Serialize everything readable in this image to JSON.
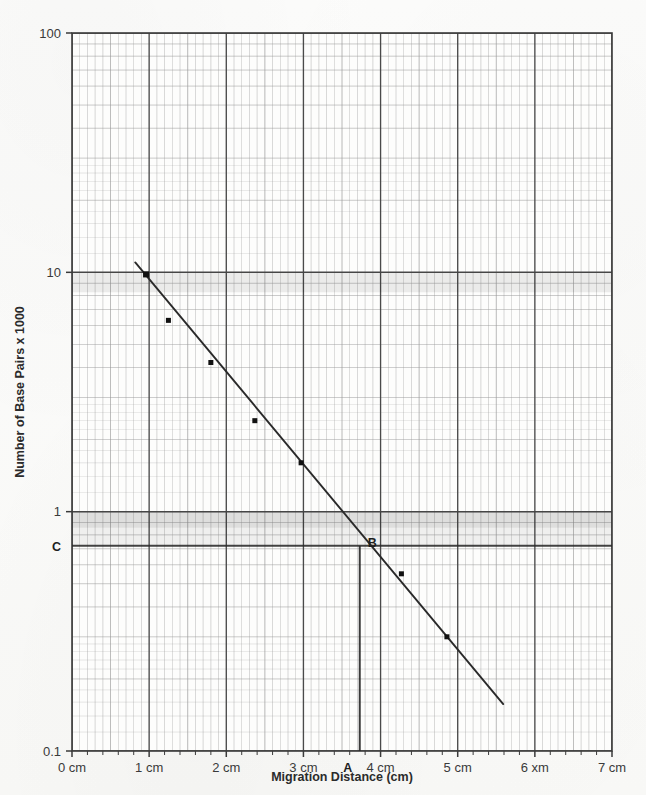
{
  "chart_data": {
    "type": "scatter",
    "title": "",
    "xlabel": "Migration Distance (cm)",
    "ylabel": "Number of Base Pairs x 1000",
    "x_scale": "linear",
    "y_scale": "log",
    "xlim": [
      0,
      7
    ],
    "ylim": [
      0.1,
      100
    ],
    "grid": "semi-log graph paper, major decade lines plus minor log divisions",
    "legend": "none",
    "x_tick_labels": [
      "0 cm",
      "1 cm",
      "2 cm",
      "3 cm",
      "4 cm",
      "5 cm",
      "6 xm",
      "7 cm"
    ],
    "x_tick_values": [
      0,
      1,
      2,
      3,
      4,
      5,
      6,
      7
    ],
    "y_tick_labels": [
      "100",
      "10",
      "1",
      "0.1"
    ],
    "y_tick_values": [
      100,
      10,
      1,
      0.1
    ],
    "series": [
      {
        "name": "DNA standard ladder",
        "marker": "filled square",
        "x": [
          0.96,
          1.25,
          1.8,
          2.37,
          2.97,
          4.27,
          4.86
        ],
        "y": [
          9.8,
          6.3,
          4.2,
          2.4,
          1.6,
          0.55,
          0.3
        ]
      }
    ],
    "fit_line": {
      "name": "best-fit standard curve",
      "x_start": 0.82,
      "y_start": 11.0,
      "x_end": 5.59,
      "y_end": 0.157
    },
    "annotations": [
      {
        "label": "A",
        "kind": "x-axis-marker",
        "x": 3.73,
        "y": 0.1,
        "description": "unknown sample migration distance on x-axis near 4 cm"
      },
      {
        "label": "B",
        "kind": "curve-intersection",
        "x": 3.73,
        "y": 0.72,
        "description": "point where vertical line from A meets the standard curve"
      },
      {
        "label": "C",
        "kind": "y-axis-marker",
        "x": 0,
        "y": 0.72,
        "description": "base pair value read off y-axis from point B"
      }
    ],
    "guide_lines": [
      {
        "name": "vertical-guide-A-to-B",
        "from": [
          3.73,
          0.1
        ],
        "to": [
          3.73,
          0.72
        ]
      },
      {
        "name": "horizontal-guide-C",
        "from": [
          0,
          0.72
        ],
        "to": [
          7,
          0.72
        ]
      }
    ]
  },
  "axes": {
    "y_title": "Number of Base Pairs x 1000",
    "x_title": "Migration Distance (cm)",
    "y_labels": [
      "100",
      "10",
      "1",
      "0.1"
    ],
    "x_labels": [
      "0 cm",
      "1 cm",
      "2 cm",
      "3 cm",
      "4 cm",
      "5 cm",
      "6 xm",
      "7 cm"
    ]
  },
  "markers": {
    "a_label": "A",
    "b_label": "B",
    "c_label": "C"
  },
  "colors": {
    "paper": "#fbfbfa",
    "grid_minor": "#9a9a9a",
    "grid_major": "#4a4a4a",
    "curve": "#2a2a2a",
    "marker": "#111111",
    "text": "#2b2b2b"
  }
}
